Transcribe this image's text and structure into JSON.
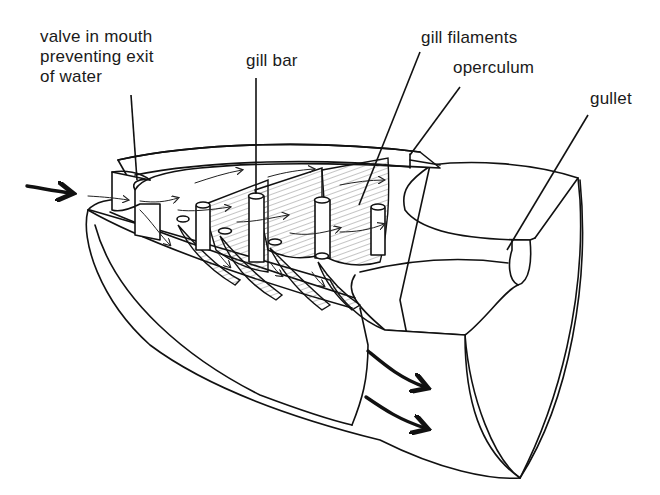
{
  "diagram": {
    "labels": {
      "valve": "valve in mouth\npreventing exit\nof water",
      "gill_bar": "gill bar",
      "gill_filaments": "gill filaments",
      "operculum": "operculum",
      "gullet": "gullet"
    },
    "arrows": {
      "inflow": "water entering mouth",
      "outflow": "water exiting under operculum"
    },
    "colors": {
      "ink": "#111111",
      "background": "#ffffff"
    }
  }
}
